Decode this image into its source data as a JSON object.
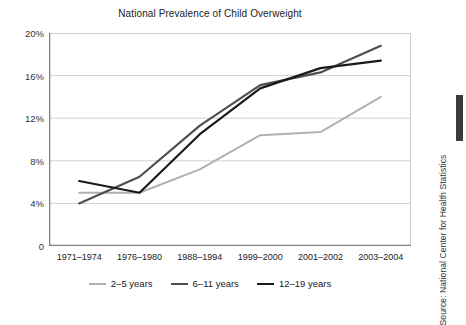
{
  "chart_data": {
    "type": "line",
    "title": "National Prevalence of Child Overweight",
    "xlabel": "",
    "ylabel": "",
    "categories": [
      "1971–1974",
      "1976–1980",
      "1988–1994",
      "1999–2000",
      "2001–2002",
      "2003–2004"
    ],
    "series": [
      {
        "name": "2–5 years",
        "color": "#b0b0b0",
        "line_width": 2.0,
        "values": [
          5.0,
          5.0,
          7.2,
          10.4,
          10.7,
          14.0
        ]
      },
      {
        "name": "6–11 years",
        "color": "#4f4f4f",
        "line_width": 2.2,
        "values": [
          4.0,
          6.5,
          11.3,
          15.1,
          16.3,
          18.8
        ]
      },
      {
        "name": "12–19 years",
        "color": "#1a1a1a",
        "line_width": 2.2,
        "values": [
          6.1,
          5.0,
          10.5,
          14.8,
          16.7,
          17.4
        ]
      }
    ],
    "ylim": [
      0,
      20
    ],
    "ytick_values": [
      0,
      4,
      8,
      12,
      16,
      20
    ],
    "ytick_labels": [
      "0",
      "4%",
      "8%",
      "12%",
      "16%",
      "20%"
    ],
    "grid": true,
    "grid_color": "#d0d0d0",
    "axis_color": "#808080",
    "legend_position": "bottom"
  },
  "source": {
    "text": "Source: National Center for Health Statistics"
  }
}
